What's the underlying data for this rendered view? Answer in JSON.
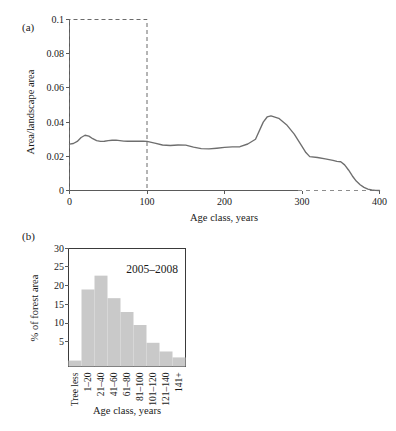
{
  "figure": {
    "panels": [
      {
        "label": "(a)",
        "chart_data": {
          "type": "line",
          "title": "",
          "xlabel": "Age class, years",
          "ylabel": "Area/landscape area",
          "xlim": [
            0,
            400
          ],
          "ylim": [
            0,
            0.1
          ],
          "xticks": [
            0,
            100,
            200,
            300,
            400
          ],
          "xtick_labels": [
            "0",
            "100",
            "200",
            "300",
            "400"
          ],
          "yticks": [
            0,
            0.02,
            0.04,
            0.06,
            0.08,
            0.1
          ],
          "ytick_labels": [
            "0",
            "0.02",
            "0.04",
            "0.06",
            "0.08",
            "0.1"
          ],
          "grid": false,
          "legend": "none",
          "annotations": [
            {
              "name": "reference-box",
              "type": "dashed-rectangle",
              "x_range": [
                0,
                100
              ],
              "y_range": [
                0,
                0.1
              ]
            },
            {
              "name": "dashed-axis-segment",
              "type": "dashed-axis",
              "x_range": [
                300,
                400
              ],
              "y": 0
            }
          ],
          "x": [
            0,
            5,
            10,
            15,
            20,
            25,
            30,
            35,
            40,
            45,
            50,
            55,
            60,
            65,
            70,
            75,
            80,
            85,
            90,
            95,
            100,
            110,
            120,
            130,
            140,
            150,
            160,
            170,
            180,
            190,
            200,
            210,
            220,
            230,
            240,
            250,
            255,
            260,
            270,
            280,
            290,
            300,
            305,
            310,
            320,
            330,
            340,
            345,
            350,
            355,
            360,
            365,
            370,
            375,
            380,
            385,
            390,
            395,
            400
          ],
          "y": [
            0.0271,
            0.0275,
            0.0287,
            0.031,
            0.0323,
            0.0318,
            0.0303,
            0.0292,
            0.0287,
            0.0288,
            0.0292,
            0.0294,
            0.0295,
            0.0292,
            0.0289,
            0.0288,
            0.0288,
            0.0288,
            0.0288,
            0.0288,
            0.0287,
            0.0277,
            0.0266,
            0.0263,
            0.0266,
            0.0265,
            0.0254,
            0.0245,
            0.0243,
            0.0247,
            0.0252,
            0.0255,
            0.0256,
            0.0272,
            0.03,
            0.04,
            0.043,
            0.0436,
            0.0422,
            0.0385,
            0.033,
            0.0258,
            0.0222,
            0.0198,
            0.0193,
            0.0185,
            0.0176,
            0.017,
            0.0168,
            0.015,
            0.012,
            0.0085,
            0.0055,
            0.0034,
            0.0018,
            0.0008,
            0.0003,
            0.0001,
            0.0
          ]
        }
      },
      {
        "label": "(b)",
        "chart_data": {
          "type": "bar",
          "title": "",
          "annotation": "2005–2008",
          "xlabel": "Age class, years",
          "ylabel": "% of forest area",
          "ylim": [
            0,
            30
          ],
          "yticks": [
            5,
            10,
            15,
            20,
            25,
            30
          ],
          "ytick_labels": [
            "5",
            "10",
            "15",
            "20",
            "25",
            "30"
          ],
          "grid": false,
          "legend": "none",
          "categories": [
            "Tree less",
            "1–20",
            "21–40",
            "41–60",
            "61–80",
            "81–100",
            "101–120",
            "121–140",
            "141+"
          ],
          "values": [
            1.5,
            19.5,
            23.0,
            17.3,
            13.8,
            10.5,
            6.0,
            3.8,
            2.3
          ]
        }
      }
    ]
  },
  "colors": {
    "line": "#6e6e6e",
    "bar_fill": "#c9c9c9",
    "axis": "#5a5a5a",
    "text": "#1a1a1a",
    "background": "#ffffff"
  }
}
